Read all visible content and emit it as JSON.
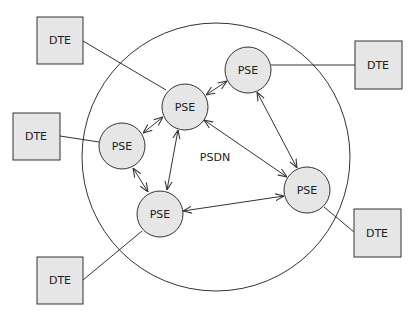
{
  "network": {
    "label": "PSDN",
    "boundary_color": "#333333"
  },
  "colors": {
    "node_fill": "#e6e6e6",
    "stroke": "#333333",
    "background": "#ffffff"
  },
  "pse_nodes": [
    {
      "id": "pse-center",
      "label": "PSE",
      "x": 185,
      "y": 107
    },
    {
      "id": "pse-left",
      "label": "PSE",
      "x": 122,
      "y": 146
    },
    {
      "id": "pse-top-right",
      "label": "PSE",
      "x": 248,
      "y": 70
    },
    {
      "id": "pse-bottom",
      "label": "PSE",
      "x": 160,
      "y": 214
    },
    {
      "id": "pse-right",
      "label": "PSE",
      "x": 307,
      "y": 190
    }
  ],
  "dte_nodes": [
    {
      "id": "dte-top-left",
      "label": "DTE",
      "x": 37,
      "y": 17
    },
    {
      "id": "dte-left",
      "label": "DTE",
      "x": 13,
      "y": 113
    },
    {
      "id": "dte-bottom-left",
      "label": "DTE",
      "x": 37,
      "y": 257
    },
    {
      "id": "dte-top-right",
      "label": "DTE",
      "x": 355,
      "y": 41
    },
    {
      "id": "dte-bottom-right",
      "label": "DTE",
      "x": 354,
      "y": 209
    }
  ],
  "links": [
    {
      "from": "dte-top-left",
      "to": "pse-center",
      "type": "line"
    },
    {
      "from": "dte-left",
      "to": "pse-left",
      "type": "line"
    },
    {
      "from": "dte-bottom-left",
      "to": "pse-bottom",
      "type": "line"
    },
    {
      "from": "dte-top-right",
      "to": "pse-top-right",
      "type": "line"
    },
    {
      "from": "dte-bottom-right",
      "to": "pse-right",
      "type": "line"
    },
    {
      "from": "pse-center",
      "to": "pse-top-right",
      "type": "bidirectional"
    },
    {
      "from": "pse-center",
      "to": "pse-left",
      "type": "bidirectional"
    },
    {
      "from": "pse-center",
      "to": "pse-bottom",
      "type": "bidirectional"
    },
    {
      "from": "pse-center",
      "to": "pse-right",
      "type": "bidirectional"
    },
    {
      "from": "pse-left",
      "to": "pse-bottom",
      "type": "bidirectional"
    },
    {
      "from": "pse-top-right",
      "to": "pse-right",
      "type": "bidirectional"
    },
    {
      "from": "pse-bottom",
      "to": "pse-right",
      "type": "bidirectional"
    }
  ]
}
